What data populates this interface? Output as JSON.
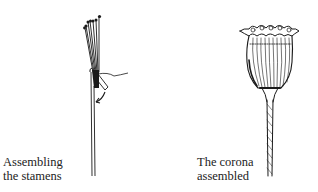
{
  "figures": [
    {
      "id": "stamens",
      "illustration": "stamens-bundle-illustration",
      "caption": {
        "line1": "Assembling",
        "line2": "the stamens"
      }
    },
    {
      "id": "corona",
      "illustration": "corona-flower-illustration",
      "caption": {
        "line1": "The corona",
        "line2": "assembled"
      }
    }
  ],
  "colors": {
    "ink": "#1a1a1a",
    "background": "#ffffff"
  }
}
